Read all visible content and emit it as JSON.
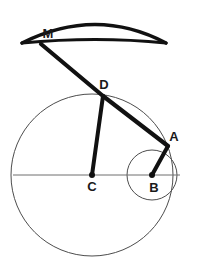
{
  "figure": {
    "background_color": "#ffffff",
    "ink_color": "#111111",
    "thin_line_color": "#4d4d4d",
    "canvas": {
      "width": 197,
      "height": 269
    }
  },
  "labels": {
    "M": "M",
    "D": "D",
    "A": "A",
    "B": "B",
    "C": "C"
  },
  "label_positions": {
    "M": {
      "x": 48,
      "y": 38
    },
    "D": {
      "x": 104,
      "y": 89
    },
    "A": {
      "x": 174,
      "y": 141
    },
    "B": {
      "x": 154,
      "y": 192
    },
    "C": {
      "x": 92,
      "y": 191
    }
  },
  "points": {
    "M": {
      "x": 41,
      "y": 44,
      "name": "point-m"
    },
    "D": {
      "x": 103,
      "y": 96,
      "name": "point-d"
    },
    "A": {
      "x": 168,
      "y": 146,
      "name": "point-a"
    },
    "B": {
      "x": 152,
      "y": 175,
      "name": "point-b"
    },
    "C": {
      "x": 92,
      "y": 175,
      "name": "point-c"
    }
  },
  "circles": {
    "large": {
      "cx": 92,
      "cy": 175,
      "r": 81,
      "stroke": "#4d4d4d",
      "stroke_width": 1
    },
    "small": {
      "cx": 152,
      "cy": 175,
      "r": 25,
      "stroke": "#4d4d4d",
      "stroke_width": 1
    }
  },
  "axis": {
    "x1": 13,
    "y1": 175,
    "x2": 180,
    "y2": 175,
    "stroke": "#6e6e6e",
    "stroke_width": 1
  },
  "lens": {
    "left_tip": {
      "x": 22,
      "y": 43
    },
    "right_tip": {
      "x": 166,
      "y": 43
    },
    "top_apex": {
      "x": 96,
      "y": 19
    },
    "bottom_apex": {
      "x": 96,
      "y": 40
    },
    "stroke": "#111111",
    "stroke_width": 3.4
  },
  "segments": [
    {
      "name": "segment-m-d",
      "x1": 41,
      "y1": 44,
      "x2": 103,
      "y2": 96,
      "width": 4.2
    },
    {
      "name": "segment-d-a",
      "x1": 103,
      "y1": 96,
      "x2": 168,
      "y2": 146,
      "width": 4.2
    },
    {
      "name": "segment-d-c",
      "x1": 103,
      "y1": 96,
      "x2": 92,
      "y2": 175,
      "width": 4.0
    },
    {
      "name": "segment-a-b",
      "x1": 168,
      "y1": 146,
      "x2": 152,
      "y2": 175,
      "width": 4.0
    }
  ],
  "dots": [
    {
      "name": "vertex-dot-c",
      "cx": 92,
      "cy": 175,
      "r": 3.0
    },
    {
      "name": "vertex-dot-b",
      "cx": 152,
      "cy": 175,
      "r": 3.0
    }
  ]
}
